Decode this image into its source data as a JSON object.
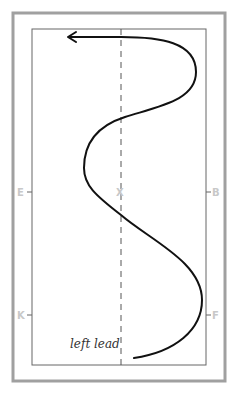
{
  "diagram": {
    "type": "arena-riding-pattern",
    "caption": "left lead",
    "markers": {
      "left_upper": "E",
      "center": "X",
      "right_upper": "B",
      "left_lower": "K",
      "right_lower": "F"
    },
    "colors": {
      "outer_border": "#a0a0a0",
      "inner_border": "#666666",
      "centerline": "#555555",
      "path": "#111111",
      "marker": "#c8c8c8"
    },
    "path_description": "Serpentine track starting bottom-center, curving right, crossing centerline at X, curving left, sweeping right, then returning left with arrowhead at top"
  }
}
